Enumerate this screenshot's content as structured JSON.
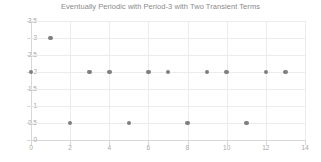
{
  "chart_data": {
    "type": "scatter",
    "title": "Eventually Periodic with Period-3 with Two Transient Terms",
    "xlabel": "",
    "ylabel": "",
    "x": [
      0,
      1,
      2,
      3,
      4,
      5,
      6,
      7,
      8,
      9,
      10,
      11,
      12,
      13
    ],
    "values": [
      2,
      3,
      0.5,
      2,
      2,
      0.5,
      2,
      2,
      0.5,
      2,
      2,
      0.5,
      2,
      2
    ],
    "series": [
      {
        "name": "sequence",
        "points": [
          {
            "x": 0,
            "y": 2
          },
          {
            "x": 1,
            "y": 3
          },
          {
            "x": 2,
            "y": 0.5
          },
          {
            "x": 3,
            "y": 2
          },
          {
            "x": 4,
            "y": 2
          },
          {
            "x": 5,
            "y": 0.5
          },
          {
            "x": 6,
            "y": 2
          },
          {
            "x": 7,
            "y": 2
          },
          {
            "x": 8,
            "y": 0.5
          },
          {
            "x": 9,
            "y": 2
          },
          {
            "x": 10,
            "y": 2
          },
          {
            "x": 11,
            "y": 0.5
          },
          {
            "x": 12,
            "y": 2
          },
          {
            "x": 13,
            "y": 2
          }
        ],
        "marker_color": "#7f7f7f"
      }
    ],
    "xlim": [
      0,
      14
    ],
    "ylim": [
      0,
      3.5
    ],
    "xticks": [
      0,
      2,
      4,
      6,
      8,
      10,
      12,
      14
    ],
    "xtick_labels": [
      "0",
      "2",
      "4",
      "6",
      "8",
      "10",
      "12",
      "14"
    ],
    "yticks": [
      0,
      0.5,
      1,
      1.5,
      2,
      2.5,
      3,
      3.5
    ],
    "ytick_labels": [
      "0",
      "0.5",
      "1",
      "1.5",
      "2",
      "2.5",
      "3",
      "3.5"
    ],
    "grid": true,
    "grid_color": "#ececec",
    "legend": false,
    "legend_position": "none",
    "background": "#ffffff",
    "title_color": "#8a8a8a",
    "tick_label_color": "#a8a8a8"
  }
}
